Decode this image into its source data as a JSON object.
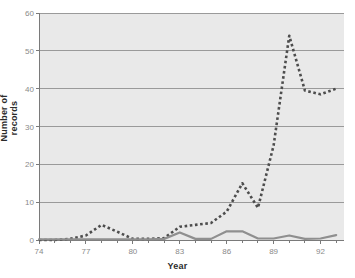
{
  "chart_data": {
    "type": "line",
    "title": "",
    "xlabel": "Year",
    "ylabel": "Number of records",
    "xlim": [
      74,
      93.5
    ],
    "ylim": [
      0,
      60
    ],
    "xticks": [
      74,
      77,
      80,
      83,
      86,
      89,
      92
    ],
    "xtick_labels": [
      "74",
      "77",
      "80",
      "83",
      "86",
      "89",
      "92"
    ],
    "xminor_step": 1,
    "yticks": [
      0,
      10,
      20,
      30,
      40,
      50,
      60
    ],
    "ytick_labels": [
      "0",
      "10",
      "20",
      "30",
      "40",
      "50",
      "60"
    ],
    "grid": true,
    "grid_axis": "y",
    "legend": "none",
    "plot_background": "#e9e9e9",
    "grid_color": "#9a9a9a",
    "axis_color": "#7a7a7a",
    "x": [
      74,
      75,
      76,
      77,
      78,
      79,
      80,
      81,
      82,
      83,
      84,
      85,
      86,
      87,
      88,
      89,
      90,
      91,
      92,
      93
    ],
    "series": [
      {
        "name": "dashed-series",
        "style": "dashed",
        "color": "#4d4d4d",
        "values": [
          0,
          0,
          0.3,
          1.2,
          4,
          2.2,
          0.3,
          0.3,
          0.5,
          3.5,
          4,
          4.5,
          7.5,
          15,
          8.5,
          25,
          54,
          39.5,
          38.5,
          40
        ]
      },
      {
        "name": "solid-series",
        "style": "solid",
        "color": "#8f8f8f",
        "values": [
          0.2,
          0.2,
          0.2,
          0.2,
          0.2,
          0.2,
          0.2,
          0.2,
          0.3,
          2,
          0.3,
          0.3,
          2.3,
          2.3,
          0.4,
          0.4,
          1.2,
          0.3,
          0.4,
          1.3
        ]
      }
    ]
  }
}
